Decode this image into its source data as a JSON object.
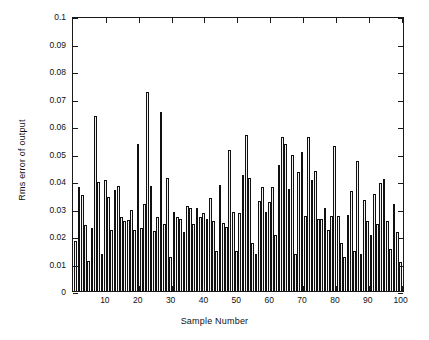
{
  "chart_data": {
    "type": "bar",
    "title": "",
    "xlabel": "Sample Number",
    "ylabel": "Rms error of output",
    "xlim": [
      0,
      101
    ],
    "ylim": [
      0,
      0.1
    ],
    "grid": false,
    "legend": null,
    "x_tick_labels": [
      "10",
      "20",
      "30",
      "40",
      "50",
      "60",
      "70",
      "80",
      "90",
      "100"
    ],
    "x_ticks": [
      10,
      20,
      30,
      40,
      50,
      60,
      70,
      80,
      90,
      100
    ],
    "y_tick_labels": [
      "0",
      "0.01",
      "0.02",
      "0.03",
      "0.04",
      "0.05",
      "0.06",
      "0.07",
      "0.08",
      "0.09",
      "0.1"
    ],
    "y_ticks": [
      0,
      0.01,
      0.02,
      0.03,
      0.04,
      0.05,
      0.06,
      0.07,
      0.08,
      0.09,
      0.1
    ],
    "bar_face_color": "#f2f2f2",
    "bar_edge_color": "#101010",
    "categories": [
      1,
      2,
      3,
      4,
      5,
      6,
      7,
      8,
      9,
      10,
      11,
      12,
      13,
      14,
      15,
      16,
      17,
      18,
      19,
      20,
      21,
      22,
      23,
      24,
      25,
      26,
      27,
      28,
      29,
      30,
      31,
      32,
      33,
      34,
      35,
      36,
      37,
      38,
      39,
      40,
      41,
      42,
      43,
      44,
      45,
      46,
      47,
      48,
      49,
      50,
      51,
      52,
      53,
      54,
      55,
      56,
      57,
      58,
      59,
      60,
      61,
      62,
      63,
      64,
      65,
      66,
      67,
      68,
      69,
      70,
      71,
      72,
      73,
      74,
      75,
      76,
      77,
      78,
      79,
      80,
      81,
      82,
      83,
      84,
      85,
      86,
      87,
      88,
      89,
      90,
      91,
      92,
      93,
      94,
      95,
      96,
      97,
      98,
      99,
      100
    ],
    "values": [
      0.0185,
      0.038,
      0.035,
      0.024,
      0.011,
      0.023,
      0.064,
      0.04,
      0.0135,
      0.0405,
      0.0345,
      0.0225,
      0.037,
      0.0385,
      0.027,
      0.0255,
      0.026,
      0.0295,
      0.0225,
      0.054,
      0.023,
      0.032,
      0.073,
      0.0385,
      0.022,
      0.027,
      0.0655,
      0.0245,
      0.0415,
      0.0125,
      0.029,
      0.027,
      0.0265,
      0.0215,
      0.031,
      0.0305,
      0.0245,
      0.0305,
      0.027,
      0.0285,
      0.0265,
      0.034,
      0.0255,
      0.0145,
      0.039,
      0.025,
      0.0235,
      0.0515,
      0.029,
      0.0145,
      0.0285,
      0.0425,
      0.057,
      0.0415,
      0.0175,
      0.0135,
      0.033,
      0.038,
      0.029,
      0.0325,
      0.038,
      0.0205,
      0.046,
      0.0565,
      0.054,
      0.0375,
      0.05,
      0.0135,
      0.0435,
      0.051,
      0.0275,
      0.0565,
      0.0405,
      0.044,
      0.0265,
      0.0265,
      0.0305,
      0.0225,
      0.0275,
      0.053,
      0.0275,
      0.0175,
      0.0125,
      0.028,
      0.0365,
      0.0145,
      0.0475,
      0.0135,
      0.0335,
      0.0255,
      0.0205,
      0.0355,
      0.0245,
      0.0395,
      0.041,
      0.0255,
      0.0155,
      0.032,
      0.0215,
      0.0105
    ]
  },
  "axes": {
    "y_axis_title": "Rms error of output",
    "x_axis_title": "Sample Number"
  }
}
